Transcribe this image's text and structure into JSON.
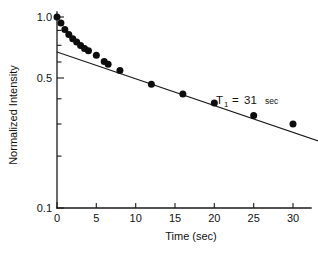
{
  "chart_data": {
    "type": "scatter",
    "title": "",
    "xlabel": "Time (sec)",
    "ylabel": "Normalized Intensity",
    "yscale": "log",
    "xscale": "linear",
    "xlim": [
      0,
      33.5
    ],
    "ylim": [
      0.1,
      1.05
    ],
    "grid": false,
    "legend": null,
    "xticks": [
      0,
      5,
      10,
      15,
      20,
      25,
      30
    ],
    "xtick_labels": [
      "0",
      "5",
      "10",
      "15",
      "20",
      "25",
      "30"
    ],
    "yticks": [
      1.0,
      0.5,
      0.1
    ],
    "ytick_labels": [
      "1.0",
      "0.5",
      "0.1"
    ],
    "yticks_minor": [
      0.9,
      0.8,
      0.7,
      0.6,
      0.4,
      0.3,
      0.2
    ],
    "series": [
      {
        "name": "Normalized intensity decay",
        "marker": "filled-circle",
        "x": [
          0.0,
          0.5,
          1.0,
          1.5,
          2.0,
          2.5,
          3.0,
          3.5,
          4.0,
          5.0,
          6.0,
          6.5,
          8.0,
          12.0,
          16.0,
          20.0,
          25.0,
          30.0
        ],
        "y": [
          1.0,
          0.93,
          0.86,
          0.81,
          0.77,
          0.74,
          0.71,
          0.685,
          0.665,
          0.63,
          0.585,
          0.565,
          0.525,
          0.445,
          0.395,
          0.355,
          0.305,
          0.275
        ]
      }
    ],
    "fit_line": {
      "name": "T1 exponential fit",
      "intercept": 0.655,
      "T1": 31,
      "x_start": 0,
      "x_end": 33.5
    },
    "annotations": [
      {
        "name": "t1-annotation",
        "symbol": "T",
        "subscript": "1",
        "equals": "=",
        "value": "31",
        "unit": "sec",
        "x": 21.5,
        "y": 0.38
      }
    ]
  },
  "axes": {
    "x_axis_label": "Time (sec)",
    "y_axis_label": "Normalized Intensity"
  }
}
